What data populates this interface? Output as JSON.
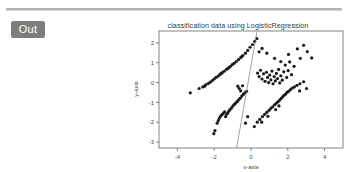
{
  "cell": {
    "out_label": "Out"
  },
  "chart_data": {
    "type": "scatter",
    "title": "classification data using LogisticRegression",
    "xlabel": "x-axis",
    "ylabel": "y-axis",
    "xlim": [
      -5.0,
      5.0
    ],
    "ylim": [
      -3.3,
      2.6
    ],
    "xticks": [
      -4,
      -2,
      0,
      2,
      4
    ],
    "yticks": [
      2,
      1,
      0,
      -1,
      -2,
      -3
    ],
    "xticklabels": [
      "-4",
      "-2",
      "0",
      "2",
      "4"
    ],
    "yticklabels": [
      "2",
      "1",
      "0",
      "-1",
      "-2",
      "-3"
    ],
    "grid": false,
    "legend": null,
    "marker": "point",
    "marker_color": "#1a1a1a",
    "marker_size": 1.6,
    "decision_boundary": {
      "label": "decision boundary",
      "color": "#7a7a7a",
      "width": 0.7,
      "x": [
        -0.78,
        0.32
      ],
      "y": [
        -3.3,
        2.55
      ]
    },
    "series": [
      {
        "name": "class 0",
        "points": [
          [
            -3.3,
            -0.52
          ],
          [
            -2.82,
            -0.3
          ],
          [
            -2.62,
            -0.22
          ],
          [
            -2.47,
            -0.12
          ],
          [
            -2.33,
            -0.05
          ],
          [
            -2.22,
            0.02
          ],
          [
            -2.1,
            0.1
          ],
          [
            -2.0,
            0.18
          ],
          [
            -1.9,
            0.26
          ],
          [
            -1.78,
            0.33
          ],
          [
            -1.68,
            0.41
          ],
          [
            -1.56,
            0.5
          ],
          [
            -1.46,
            0.57
          ],
          [
            -1.34,
            0.66
          ],
          [
            -1.24,
            0.72
          ],
          [
            -1.12,
            0.82
          ],
          [
            -1.02,
            0.9
          ],
          [
            -0.92,
            0.97
          ],
          [
            -0.8,
            1.06
          ],
          [
            -0.68,
            1.16
          ],
          [
            -0.56,
            1.26
          ],
          [
            -0.44,
            1.36
          ],
          [
            -0.3,
            1.48
          ],
          [
            -0.18,
            1.62
          ],
          [
            -0.05,
            1.78
          ],
          [
            0.08,
            1.92
          ],
          [
            0.2,
            2.08
          ],
          [
            0.32,
            2.22
          ],
          [
            -0.52,
            1.3
          ],
          [
            -1.62,
            0.46
          ],
          [
            -2.52,
            -0.18
          ],
          [
            -1.2,
            0.76
          ],
          [
            0.44,
            1.55
          ],
          [
            0.6,
            1.72
          ]
        ]
      },
      {
        "name": "class 1",
        "points": [
          [
            -2.02,
            -2.58
          ],
          [
            -1.96,
            -2.42
          ],
          [
            -1.84,
            -2.05
          ],
          [
            -1.78,
            -1.92
          ],
          [
            -1.72,
            -1.8
          ],
          [
            -1.66,
            -1.7
          ],
          [
            -1.58,
            -1.62
          ],
          [
            -1.5,
            -1.55
          ],
          [
            -1.44,
            -1.48
          ],
          [
            -1.38,
            -1.72
          ],
          [
            -1.32,
            -1.6
          ],
          [
            -1.26,
            -1.52
          ],
          [
            -1.2,
            -1.44
          ],
          [
            -1.14,
            -1.36
          ],
          [
            -1.06,
            -1.28
          ],
          [
            -0.98,
            -1.18
          ],
          [
            -0.9,
            -1.1
          ],
          [
            -0.82,
            -1.02
          ],
          [
            -0.74,
            -0.95
          ],
          [
            -0.66,
            -0.86
          ],
          [
            -0.58,
            -0.78
          ],
          [
            -0.5,
            -0.68
          ],
          [
            -0.42,
            -0.6
          ],
          [
            -0.34,
            -0.52
          ],
          [
            -0.56,
            -0.42
          ],
          [
            -0.64,
            -0.3
          ],
          [
            -0.72,
            -0.18
          ],
          [
            -0.46,
            -0.16
          ],
          [
            -0.24,
            -0.44
          ],
          [
            -0.3,
            -2.05
          ],
          [
            -0.18,
            -1.72
          ]
        ]
      },
      {
        "name": "class 2",
        "points": [
          [
            0.36,
            0.48
          ],
          [
            0.44,
            0.3
          ],
          [
            0.52,
            0.62
          ],
          [
            0.6,
            0.18
          ],
          [
            0.68,
            0.44
          ],
          [
            0.76,
            0.06
          ],
          [
            0.84,
            0.52
          ],
          [
            0.9,
            0.26
          ],
          [
            0.96,
            0.0
          ],
          [
            1.02,
            0.38
          ],
          [
            1.08,
            0.14
          ],
          [
            1.14,
            0.58
          ],
          [
            1.2,
            -0.06
          ],
          [
            1.26,
            0.3
          ],
          [
            1.32,
            0.08
          ],
          [
            1.38,
            0.46
          ],
          [
            1.44,
            0.2
          ],
          [
            1.5,
            0.66
          ],
          [
            1.56,
            -0.02
          ],
          [
            1.62,
            0.34
          ],
          [
            1.7,
            0.12
          ],
          [
            1.78,
            0.54
          ],
          [
            1.86,
            0.88
          ],
          [
            1.94,
            0.26
          ],
          [
            2.02,
            0.6
          ],
          [
            2.1,
            1.04
          ],
          [
            2.2,
            0.4
          ],
          [
            2.34,
            0.82
          ],
          [
            2.52,
            1.7
          ],
          [
            2.68,
            1.22
          ],
          [
            2.86,
            1.88
          ],
          [
            3.06,
            1.56
          ],
          [
            3.3,
            1.24
          ],
          [
            1.28,
            1.22
          ],
          [
            1.62,
            1.06
          ],
          [
            0.86,
            1.48
          ],
          [
            2.04,
            1.42
          ]
        ]
      },
      {
        "name": "class 3",
        "points": [
          [
            0.18,
            -2.22
          ],
          [
            0.34,
            -2.0
          ],
          [
            0.48,
            -1.86
          ],
          [
            0.62,
            -1.72
          ],
          [
            0.74,
            -1.6
          ],
          [
            0.86,
            -1.5
          ],
          [
            0.98,
            -1.4
          ],
          [
            1.08,
            -1.3
          ],
          [
            1.18,
            -1.22
          ],
          [
            1.28,
            -1.12
          ],
          [
            1.38,
            -1.04
          ],
          [
            1.48,
            -0.96
          ],
          [
            1.56,
            -0.88
          ],
          [
            1.64,
            -0.8
          ],
          [
            1.72,
            -0.72
          ],
          [
            1.8,
            -0.64
          ],
          [
            1.88,
            -0.58
          ],
          [
            1.96,
            -0.5
          ],
          [
            2.04,
            -0.44
          ],
          [
            2.14,
            -0.36
          ],
          [
            2.24,
            -0.28
          ],
          [
            2.36,
            -0.22
          ],
          [
            2.5,
            -0.14
          ],
          [
            2.66,
            -0.06
          ],
          [
            2.86,
            0.04
          ],
          [
            1.34,
            -1.36
          ],
          [
            1.52,
            -1.18
          ],
          [
            0.92,
            -1.7
          ],
          [
            0.58,
            -2.0
          ],
          [
            2.64,
            -0.42
          ],
          [
            3.02,
            -0.3
          ]
        ]
      }
    ]
  }
}
